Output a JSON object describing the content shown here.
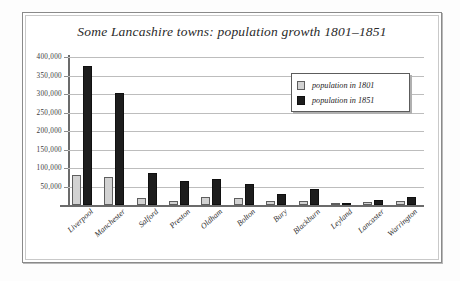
{
  "chart_data": {
    "type": "bar",
    "title": "Some Lancashire towns: population growth 1801–1851",
    "xlabel": "",
    "ylabel": "",
    "ylim": [
      0,
      400000
    ],
    "grid": true,
    "legend_position": "upper-right",
    "categories": [
      "Liverpool",
      "Manchester",
      "Salford",
      "Preston",
      "Oldham",
      "Bolton",
      "Bury",
      "Blackburn",
      "Leyland",
      "Lancaster",
      "Warrington"
    ],
    "ytick_labels": [
      "400,000",
      "350,000",
      "300,000",
      "250,000",
      "200,000",
      "150,000",
      "100,000",
      "50,000"
    ],
    "ytick_values": [
      400000,
      350000,
      300000,
      250000,
      200000,
      150000,
      100000,
      50000
    ],
    "series": [
      {
        "name": "population in 1801",
        "color": "#d2d2d2",
        "values": [
          82000,
          75000,
          20000,
          12000,
          22000,
          18000,
          10000,
          12000,
          3000,
          9000,
          11000
        ]
      },
      {
        "name": "population in 1851",
        "color": "#1d1d1d",
        "values": [
          376000,
          303000,
          87000,
          66000,
          69000,
          57000,
          31000,
          42000,
          5000,
          14000,
          21000
        ]
      }
    ]
  },
  "legend": {
    "items": [
      {
        "label": "population in 1801",
        "swatch": "light-gray"
      },
      {
        "label": "population in 1851",
        "swatch": "black"
      }
    ]
  }
}
